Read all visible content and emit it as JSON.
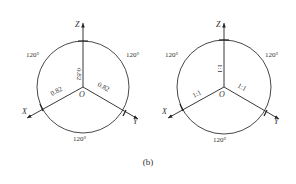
{
  "figure": {
    "caption": "(b)",
    "left": {
      "axes": {
        "z": "Z",
        "x": "X",
        "y": "Y",
        "origin": "O"
      },
      "coefficients": {
        "z": "0.82",
        "x": "0.82",
        "y": "0.82"
      },
      "angles": {
        "top_left": "120°",
        "top_right": "120°",
        "bottom": "120°"
      }
    },
    "right": {
      "axes": {
        "z": "Z",
        "x": "X",
        "y": "Y",
        "origin": "O"
      },
      "coefficients": {
        "z": "1:1",
        "x": "1:1",
        "y": "1:1"
      },
      "angles": {
        "top_left": "120°",
        "top_right": "120°",
        "bottom": "120°"
      }
    }
  }
}
